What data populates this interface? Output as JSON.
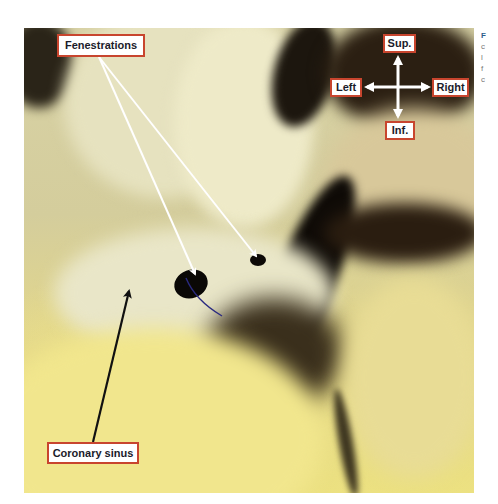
{
  "figure": {
    "labels": {
      "fenestrations": "Fenestrations",
      "coronary_sinus": "Coronary sinus"
    },
    "orientation": {
      "sup": "Sup.",
      "inf": "Inf.",
      "left": "Left",
      "right": "Right"
    },
    "colors": {
      "label_border": "#c8452e",
      "label_text": "#1b1b2a",
      "white_arrow": "#ffffff",
      "black_arrow": "#111111"
    }
  },
  "caption_fragment": {
    "lines": [
      "F",
      "c",
      "l",
      "f",
      "c"
    ]
  }
}
